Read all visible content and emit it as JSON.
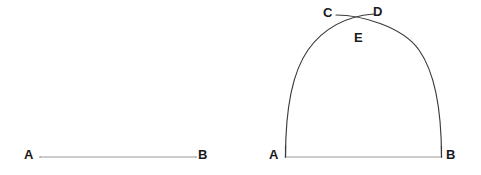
{
  "figure": {
    "background_color": "#ffffff",
    "segment_color": "#9a9a9a",
    "arc_color": "#3a3a3a",
    "label_color": "#1a1a1a",
    "width": 481,
    "height": 175
  },
  "left_figure": {
    "name": "plain-segment",
    "labels": {
      "a": "A",
      "b": "B"
    },
    "segment": {
      "x1": 40,
      "y1": 157,
      "x2": 196,
      "y2": 157,
      "color": "#9a9a9a",
      "stroke_width": 1.1
    }
  },
  "right_figure": {
    "name": "arch-construction",
    "labels": {
      "a": "A",
      "b": "B",
      "c": "C",
      "d": "D",
      "e": "E"
    },
    "baseline": {
      "x1": 285,
      "y1": 157,
      "x2": 442,
      "y2": 157,
      "color": "#9a9a9a",
      "stroke_width": 1.1
    },
    "arc_left": {
      "center_x": 285,
      "center_y": 157,
      "radius": 157,
      "description": "arc centered at A passing through B, drawn from A upward crossing past E toward D",
      "path": "M 285 157 C 285 78 318 22 373 14",
      "color": "#3a3a3a",
      "stroke_width": 1.2
    },
    "arc_right": {
      "center_x": 442,
      "center_y": 157,
      "radius": 157,
      "description": "arc centered at B passing through A, drawn from B upward crossing past E toward C",
      "path": "M 442 157 C 442 78 391 16 336 15",
      "color": "#3a3a3a",
      "stroke_width": 1.2
    },
    "intersection": {
      "label": "E",
      "x": 360,
      "y": 23
    }
  }
}
